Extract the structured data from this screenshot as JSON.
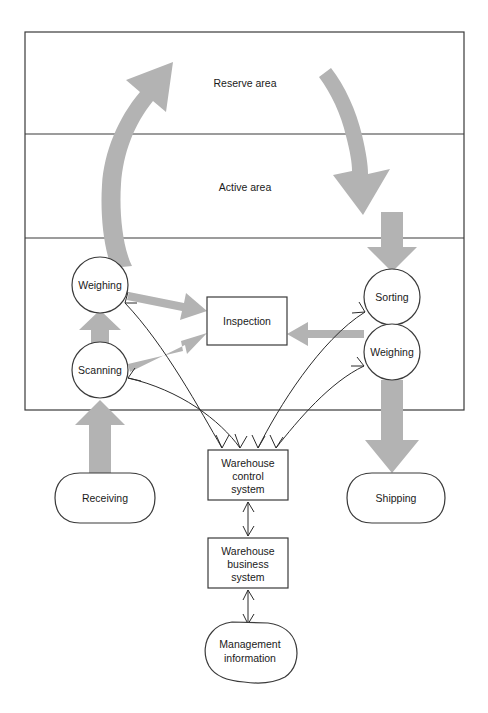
{
  "diagram": {
    "colors": {
      "fat_arrow_fill": "#b3b3b3",
      "outline_stroke": "#3a3a3a",
      "text": "#1a1a1a",
      "background": "#ffffff"
    },
    "areas": [
      {
        "id": "reserve",
        "label": "Reserve area"
      },
      {
        "id": "active",
        "label": "Active area"
      },
      {
        "id": "operations",
        "label": ""
      }
    ],
    "nodes": [
      {
        "id": "weighing-left",
        "label": "Weighing",
        "shape": "circle"
      },
      {
        "id": "scanning",
        "label": "Scanning",
        "shape": "circle"
      },
      {
        "id": "sorting",
        "label": "Sorting",
        "shape": "circle"
      },
      {
        "id": "weighing-right",
        "label": "Weighing",
        "shape": "circle"
      },
      {
        "id": "inspection",
        "label": "Inspection",
        "shape": "rectangle"
      },
      {
        "id": "receiving",
        "label": "Receiving",
        "shape": "rounded-terminator"
      },
      {
        "id": "shipping",
        "label": "Shipping",
        "shape": "rounded-terminator"
      },
      {
        "id": "warehouse-control-system",
        "label": "Warehouse control system",
        "shape": "rectangle",
        "lines": [
          "Warehouse",
          "control",
          "system"
        ]
      },
      {
        "id": "warehouse-business-system",
        "label": "Warehouse business system",
        "shape": "rectangle",
        "lines": [
          "Warehouse",
          "business",
          "system"
        ]
      },
      {
        "id": "management-information",
        "label": "Management information",
        "shape": "octagon",
        "lines": [
          "Management",
          "information"
        ]
      }
    ],
    "flows": [
      {
        "from": "receiving",
        "to": "scanning",
        "style": "thick-gray"
      },
      {
        "from": "scanning",
        "to": "weighing-left",
        "style": "thick-gray"
      },
      {
        "from": "scanning",
        "to": "inspection",
        "style": "thick-gray"
      },
      {
        "from": "weighing-left",
        "to": "inspection",
        "style": "thick-gray"
      },
      {
        "from": "weighing-left",
        "to": "reserve-area",
        "style": "thick-gray-curved"
      },
      {
        "from": "reserve-area",
        "to": "active-area",
        "style": "thick-gray-curved"
      },
      {
        "from": "active-area",
        "to": "sorting",
        "style": "thick-gray"
      },
      {
        "from": "weighing-right",
        "to": "inspection",
        "style": "thick-gray"
      },
      {
        "from": "weighing-right",
        "to": "shipping",
        "style": "thick-gray"
      },
      {
        "from": "warehouse-control-system",
        "to": "weighing-left",
        "style": "thin-arrow"
      },
      {
        "from": "warehouse-control-system",
        "to": "scanning",
        "style": "thin-arrow"
      },
      {
        "from": "warehouse-control-system",
        "to": "sorting",
        "style": "thin-arrow"
      },
      {
        "from": "warehouse-control-system",
        "to": "weighing-right",
        "style": "thin-arrow"
      },
      {
        "from": "warehouse-control-system",
        "to": "warehouse-business-system",
        "style": "thin-double-arrow"
      },
      {
        "from": "warehouse-business-system",
        "to": "management-information",
        "style": "thin-double-arrow"
      }
    ]
  },
  "labels": {
    "reserve_area": "Reserve area",
    "active_area": "Active area",
    "weighing_left": "Weighing",
    "scanning": "Scanning",
    "sorting": "Sorting",
    "weighing_right": "Weighing",
    "inspection": "Inspection",
    "receiving": "Receiving",
    "shipping": "Shipping",
    "wcs_line1": "Warehouse",
    "wcs_line2": "control",
    "wcs_line3": "system",
    "wbs_line1": "Warehouse",
    "wbs_line2": "business",
    "wbs_line3": "system",
    "mi_line1": "Management",
    "mi_line2": "information"
  }
}
